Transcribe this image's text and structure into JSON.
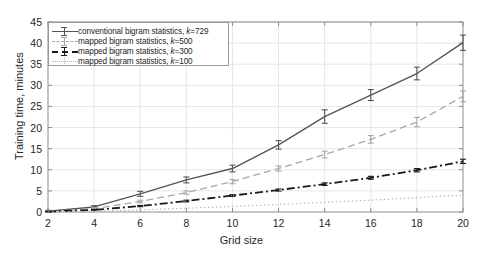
{
  "chart_data": {
    "type": "line",
    "title": "",
    "xlabel": "Grid size",
    "ylabel": "Training time, minutes",
    "xlim": [
      2,
      20
    ],
    "ylim": [
      0,
      45
    ],
    "xticks": [
      2,
      4,
      6,
      8,
      10,
      12,
      14,
      16,
      18,
      20
    ],
    "yticks": [
      0,
      5,
      10,
      15,
      20,
      25,
      30,
      35,
      40,
      45
    ],
    "grid": true,
    "legend_position": "top-left",
    "x": [
      2,
      4,
      6,
      8,
      10,
      12,
      14,
      16,
      18,
      20
    ],
    "series": [
      {
        "name": "conventional bigram statistics, k=729",
        "label_prefix": "conventional bigram statistics, ",
        "label_k": "k",
        "label_suffix": "=729",
        "style": "solid-error",
        "color": "#555555",
        "values": [
          0.2,
          1.2,
          4.3,
          7.6,
          10.3,
          15.9,
          22.6,
          27.7,
          32.8,
          40.1
        ],
        "errors": [
          0.2,
          0.3,
          0.6,
          0.7,
          0.8,
          1.0,
          1.6,
          1.3,
          1.5,
          1.8
        ]
      },
      {
        "name": "mapped bigram statistics, k=500",
        "label_prefix": "mapped bigram statistics, ",
        "label_k": "k",
        "label_suffix": "=500",
        "style": "dashed-error",
        "color": "#a8a8a8",
        "values": [
          0.15,
          0.8,
          2.5,
          4.6,
          7.2,
          10.3,
          13.6,
          17.2,
          21.3,
          27.4
        ],
        "errors": [
          0.1,
          0.2,
          0.3,
          0.4,
          0.5,
          0.6,
          0.8,
          0.9,
          1.1,
          1.3
        ]
      },
      {
        "name": "mapped bigram statistics, k=300",
        "label_prefix": "mapped bigram statistics, ",
        "label_k": "k",
        "label_suffix": "=300",
        "style": "dashdot-error",
        "color": "#1a1a1a",
        "values": [
          0.1,
          0.5,
          1.4,
          2.6,
          3.9,
          5.2,
          6.6,
          8.1,
          9.9,
          12.0
        ],
        "errors": [
          0.05,
          0.1,
          0.15,
          0.2,
          0.2,
          0.25,
          0.3,
          0.35,
          0.4,
          0.5
        ]
      },
      {
        "name": "mapped bigram statistics, k=100",
        "label_prefix": "mapped bigram statistics, ",
        "label_k": "k",
        "label_suffix": "=100",
        "style": "dotted",
        "color": "#b5b5b5",
        "values": [
          0.05,
          0.2,
          0.5,
          0.9,
          1.3,
          1.8,
          2.3,
          2.8,
          3.4,
          4.0
        ],
        "errors": [
          0.02,
          0.04,
          0.06,
          0.08,
          0.1,
          0.1,
          0.12,
          0.14,
          0.16,
          0.2
        ]
      }
    ]
  },
  "axes": {
    "ylabel": "Training time, minutes",
    "xlabel": "Grid size",
    "ytick_labels": [
      "0",
      "5",
      "10",
      "15",
      "20",
      "25",
      "30",
      "35",
      "40",
      "45"
    ],
    "xtick_labels": [
      "2",
      "4",
      "6",
      "8",
      "10",
      "12",
      "14",
      "16",
      "18",
      "20"
    ]
  },
  "colors": {
    "background": "#ffffff",
    "axis": "#8c8c8c",
    "grid": "#e6e6e6",
    "text": "#262626",
    "series1": "#555555",
    "series2": "#a8a8a8",
    "series3": "#1a1a1a",
    "series4": "#b5b5b5"
  }
}
